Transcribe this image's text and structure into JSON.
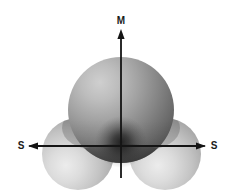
{
  "figure": {
    "kind": "orbital-lobe-diagram",
    "background_color": "#ffffff",
    "width": 233,
    "height": 194,
    "axis_color": "#141414",
    "origin": {
      "x": 121,
      "y": 146
    },
    "labels": {
      "vertical_top": "M",
      "horizontal_left": "S",
      "horizontal_right": "S"
    },
    "axes": [
      {
        "name": "vertical-axis",
        "label": "M",
        "orientation": "vertical",
        "arrow_direction": "up",
        "from": {
          "x": 121,
          "y": 176
        },
        "to": {
          "x": 121,
          "y": 31
        },
        "label_position": {
          "x": 121,
          "y": 20
        }
      },
      {
        "name": "horizontal-axis-left",
        "label": "S",
        "orientation": "horizontal",
        "arrow_direction": "left",
        "from": {
          "x": 121,
          "y": 146
        },
        "to": {
          "x": 29,
          "y": 146
        },
        "label_position": {
          "x": 21,
          "y": 146
        }
      },
      {
        "name": "horizontal-axis-right",
        "label": "S",
        "orientation": "horizontal",
        "arrow_direction": "right",
        "from": {
          "x": 121,
          "y": 146
        },
        "to": {
          "x": 205,
          "y": 146
        },
        "label_position": {
          "x": 214,
          "y": 146
        }
      }
    ],
    "lobes": [
      {
        "name": "lobe-top",
        "center": {
          "x": 121,
          "y": 110
        },
        "radius": 53,
        "tone": "dark",
        "highlight": {
          "x": 92,
          "y": 76
        },
        "light_color": "#b8b8b8",
        "mid_color": "#8e8e8e",
        "dark_color": "#3a3a3a"
      },
      {
        "name": "lobe-bottom-left",
        "center": {
          "x": 78,
          "y": 154
        },
        "radius": 36,
        "tone": "light",
        "highlight": {
          "x": 66,
          "y": 166
        },
        "light_color": "#e2e2e2",
        "mid_color": "#bdbdbd",
        "dark_color": "#8a8a8a"
      },
      {
        "name": "lobe-bottom-right",
        "center": {
          "x": 165,
          "y": 154
        },
        "radius": 36,
        "tone": "light",
        "highlight": {
          "x": 155,
          "y": 166
        },
        "light_color": "#e2e2e2",
        "mid_color": "#bdbdbd",
        "dark_color": "#8a8a8a"
      }
    ],
    "origin_shadow": {
      "name": "origin-shadow",
      "center": {
        "x": 121,
        "y": 142
      },
      "radius": 26,
      "color": "#1f1f1f"
    }
  }
}
